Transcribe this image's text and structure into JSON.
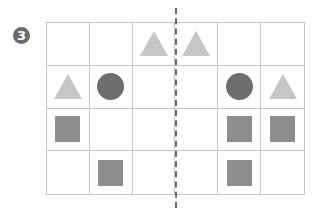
{
  "badge": {
    "label": "3"
  },
  "grid": {
    "rows": 4,
    "cols": 6,
    "cells": [
      [
        "",
        "",
        "triangle",
        "triangle",
        "",
        ""
      ],
      [
        "triangle",
        "circle",
        "",
        "",
        "circle",
        "triangle"
      ],
      [
        "square",
        "",
        "",
        "",
        "square",
        "square"
      ],
      [
        "",
        "square",
        "",
        "",
        "square",
        ""
      ]
    ]
  },
  "colors": {
    "triangle": "#c6c6c6",
    "circle": "#6e6e6e",
    "square": "#8d8d8d",
    "grid_line": "#c4c4c4",
    "symmetry_line": "#6a6a6a"
  },
  "symmetry_line": {
    "style": "dashed",
    "orientation": "vertical",
    "position": "between column 3 and column 4"
  }
}
